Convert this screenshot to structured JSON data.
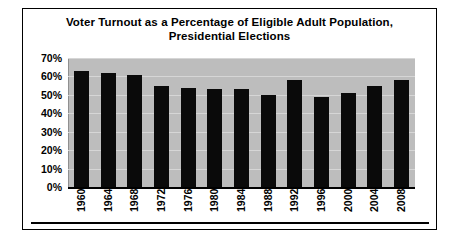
{
  "chart_data": {
    "type": "bar",
    "title": "Voter Turnout as a Percentage of Eligible Adult Population, Presidential Elections",
    "title_line_1": "Voter Turnout as a Percentage of Eligible Adult Population,",
    "title_line_2": "Presidential Elections",
    "xlabel": "",
    "ylabel": "",
    "ylim": [
      0,
      70
    ],
    "y_tick_labels": [
      "70%",
      "60%",
      "50%",
      "40%",
      "30%",
      "20%",
      "10%",
      "0%"
    ],
    "y_tick_values": [
      70,
      60,
      50,
      40,
      30,
      20,
      10,
      0
    ],
    "grid": true,
    "legend": "none",
    "categories": [
      "1960",
      "1964",
      "1968",
      "1972",
      "1976",
      "1980",
      "1984",
      "1988",
      "1992",
      "1996",
      "2000",
      "2004",
      "2008"
    ],
    "values": [
      63,
      62,
      61,
      55,
      54,
      53,
      53,
      50,
      58,
      49,
      51,
      55,
      58
    ],
    "bar_color": "#0a0a0a",
    "plot_background": "#bdbdbd",
    "gridline_color": "#d6d6d6"
  }
}
